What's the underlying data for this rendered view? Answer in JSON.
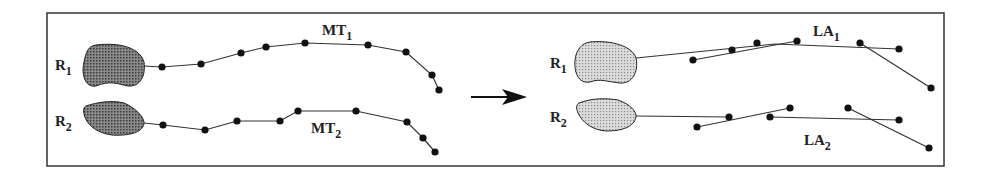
{
  "diagram": {
    "frame": {
      "x": 47,
      "y": 13,
      "w": 897,
      "h": 153,
      "stroke": "#333333"
    },
    "colors": {
      "line": "#333333",
      "dot": "#111111",
      "region_left": "#6e6e6e",
      "region_right": "#c8c8c8"
    },
    "left_panel": {
      "regions": [
        {
          "label": "R",
          "sub": "1",
          "label_pos": [
            55,
            70
          ]
        },
        {
          "label": "R",
          "sub": "2",
          "label_pos": [
            55,
            126
          ]
        }
      ],
      "tracks": [
        {
          "label": "MT",
          "sub": "1",
          "label_pos": [
            322,
            35
          ],
          "points": [
            [
              144,
              66
            ],
            [
              162,
              67
            ],
            [
              201,
              64
            ],
            [
              241,
              53
            ],
            [
              266,
              47
            ],
            [
              305,
              43
            ],
            [
              368,
              45
            ],
            [
              406,
              52
            ],
            [
              432,
              75
            ],
            [
              439,
              90
            ]
          ]
        },
        {
          "label": "MT",
          "sub": "2",
          "label_pos": [
            311,
            133
          ],
          "points": [
            [
              144,
              123
            ],
            [
              163,
              125
            ],
            [
              205,
              130
            ],
            [
              237,
              121
            ],
            [
              280,
              121
            ],
            [
              298,
              111
            ],
            [
              356,
              111
            ],
            [
              407,
              122
            ],
            [
              423,
              138
            ],
            [
              435,
              152
            ]
          ]
        }
      ]
    },
    "arrow": {
      "from": [
        471,
        97
      ],
      "to": [
        527,
        97
      ]
    },
    "right_panel": {
      "regions": [
        {
          "label": "R",
          "sub": "1",
          "label_pos": [
            550,
            68
          ]
        },
        {
          "label": "R",
          "sub": "2",
          "label_pos": [
            550,
            122
          ]
        }
      ],
      "line_approximations": [
        {
          "label": "LA",
          "sub": "1",
          "label_pos": [
            813,
            36
          ],
          "segments": [
            [
              [
                636,
                58
              ],
              [
                775,
                44
              ],
              [
                899,
                49
              ]
            ],
            [
              [
                693,
                60
              ],
              [
                797,
                41
              ]
            ],
            [
              [
                860,
                43
              ],
              [
                931,
                88
              ]
            ]
          ],
          "dots": [
            [
              693,
              60
            ],
            [
              732,
              50
            ],
            [
              757,
              43
            ],
            [
              797,
              41
            ],
            [
              860,
              43
            ],
            [
              899,
              49
            ],
            [
              931,
              88
            ]
          ]
        },
        {
          "label": "LA",
          "sub": "2",
          "label_pos": [
            804,
            145
          ],
          "segments": [
            [
              [
                636,
                116
              ],
              [
                729,
                117
              ]
            ],
            [
              [
                697,
                127
              ],
              [
                790,
                108
              ]
            ],
            [
              [
                770,
                117
              ],
              [
                899,
                120
              ]
            ],
            [
              [
                848,
                108
              ],
              [
                929,
                148
              ]
            ]
          ],
          "dots": [
            [
              697,
              127
            ],
            [
              729,
              117
            ],
            [
              770,
              117
            ],
            [
              790,
              108
            ],
            [
              848,
              108
            ],
            [
              899,
              120
            ],
            [
              929,
              148
            ]
          ]
        }
      ]
    }
  }
}
